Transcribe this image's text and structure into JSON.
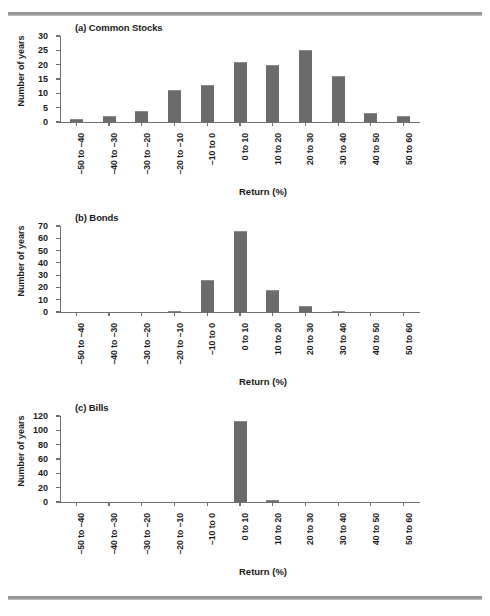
{
  "figure": {
    "has_top_rule": true,
    "has_bottom_rule": true,
    "bar_color": "#6b6b6b",
    "axis_color": "#6f6f6f",
    "text_color": "#1a1a1a"
  },
  "axis_titles": {
    "x": "Return (%)",
    "y": "Number of years"
  },
  "categories": [
    "–50 to –40",
    "–40 to –30",
    "–30 to –20",
    "–20 to –10",
    "–10 to 0",
    "0 to 10",
    "10 to 20",
    "20 to 30",
    "30 to 40",
    "40 to 50",
    "50 to 60"
  ],
  "panels": [
    {
      "title": "(a) Common Stocks",
      "ylabel": "Number of years",
      "xlabel": "Return (%)",
      "yticks": [
        0,
        5,
        10,
        15,
        20,
        25,
        30
      ],
      "ymax": 30,
      "values": [
        1,
        2,
        4,
        11,
        13,
        21,
        20,
        25,
        16,
        3,
        2
      ]
    },
    {
      "title": "(b) Bonds",
      "ylabel": "Number of years",
      "xlabel": "Return (%)",
      "yticks": [
        0,
        10,
        20,
        30,
        40,
        50,
        60,
        70
      ],
      "ymax": 70,
      "values": [
        0,
        0,
        0,
        1,
        26,
        66,
        18,
        5,
        1,
        0,
        0
      ]
    },
    {
      "title": "(c) Bills",
      "ylabel": "Number of years",
      "xlabel": "Return (%)",
      "yticks": [
        0,
        20,
        40,
        60,
        80,
        100,
        120
      ],
      "ymax": 120,
      "values": [
        0,
        0,
        0,
        0,
        0,
        113,
        3,
        0,
        0,
        0,
        0
      ]
    }
  ],
  "chart_data": {
    "type": "bar",
    "xlabel": "Return (%)",
    "ylabel": "Number of years",
    "grid": false,
    "legend": "none",
    "categories": [
      "–50 to –40",
      "–40 to –30",
      "–30 to –20",
      "–20 to –10",
      "–10 to 0",
      "0 to 10",
      "10 to 20",
      "20 to 30",
      "30 to 40",
      "40 to 50",
      "50 to 60"
    ],
    "panels": [
      {
        "panel": "(a) Common Stocks",
        "ylim": [
          0,
          30
        ],
        "ytick_step": 5,
        "values": [
          1,
          2,
          4,
          11,
          13,
          21,
          20,
          25,
          16,
          3,
          2
        ]
      },
      {
        "panel": "(b) Bonds",
        "ylim": [
          0,
          70
        ],
        "ytick_step": 10,
        "values": [
          0,
          0,
          0,
          1,
          26,
          66,
          18,
          5,
          1,
          0,
          0
        ]
      },
      {
        "panel": "(c) Bills",
        "ylim": [
          0,
          120
        ],
        "ytick_step": 20,
        "values": [
          0,
          0,
          0,
          0,
          0,
          113,
          3,
          0,
          0,
          0,
          0
        ]
      }
    ]
  }
}
